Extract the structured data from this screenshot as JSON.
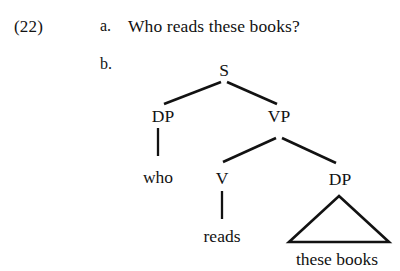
{
  "example": {
    "number": "(22)",
    "items": [
      {
        "label": "a.",
        "text": "Who reads these books?"
      },
      {
        "label": "b.",
        "text": ""
      }
    ]
  },
  "tree": {
    "nodes": {
      "s": "S",
      "dp_subject": "DP",
      "vp": "VP",
      "v": "V",
      "dp_object": "DP"
    },
    "terminals": {
      "who": "who",
      "reads": "reads",
      "these_books": "these books"
    }
  },
  "colors": {
    "ink": "#121212",
    "background": "#ffffff"
  }
}
